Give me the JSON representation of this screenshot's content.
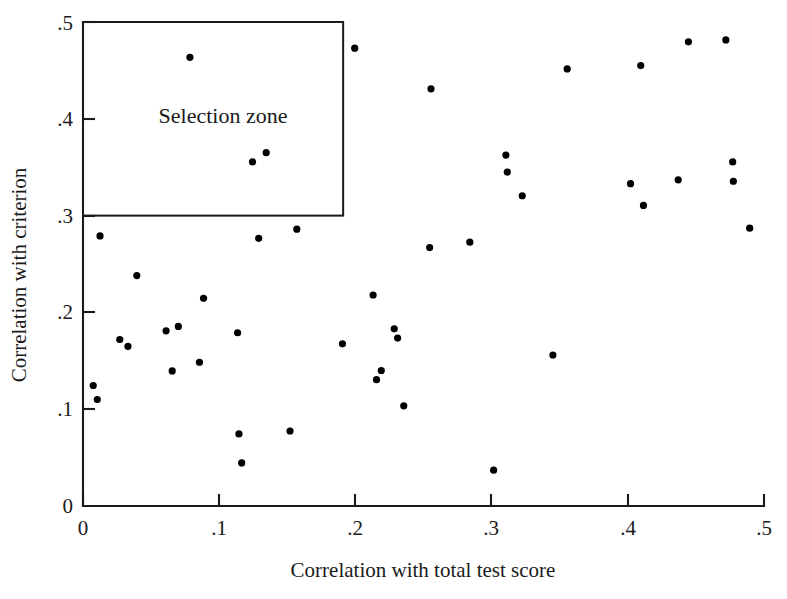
{
  "chart_data": {
    "type": "scatter",
    "title": "",
    "xlabel": "Correlation with total test score",
    "ylabel": "Correlation with criterion",
    "xlim": [
      0,
      0.5
    ],
    "ylim": [
      0,
      0.5
    ],
    "grid": false,
    "legend": null,
    "xticks": [
      0,
      0.1,
      0.2,
      0.3,
      0.4,
      0.5
    ],
    "yticks": [
      0,
      0.1,
      0.2,
      0.3,
      0.4,
      0.5
    ],
    "xtick_labels": [
      "0",
      ".1",
      ".2",
      ".3",
      ".4",
      ".5"
    ],
    "ytick_labels": [
      "0",
      ".1",
      ".2",
      ".3",
      ".4",
      ".5"
    ],
    "annotations": [
      {
        "name": "selection-zone",
        "label": "Selection zone",
        "x_range": [
          0.0,
          0.191
        ],
        "y_range": [
          0.3,
          0.5
        ]
      }
    ],
    "marker": {
      "shape": "circle",
      "color": "#000000",
      "size_px": 7.2
    },
    "points": [
      {
        "x": 0.0785,
        "y": 0.4635
      },
      {
        "x": 0.1245,
        "y": 0.3555
      },
      {
        "x": 0.1345,
        "y": 0.365
      },
      {
        "x": 0.1995,
        "y": 0.473
      },
      {
        "x": 0.2555,
        "y": 0.431
      },
      {
        "x": 0.3555,
        "y": 0.4515
      },
      {
        "x": 0.4095,
        "y": 0.455
      },
      {
        "x": 0.4445,
        "y": 0.4795
      },
      {
        "x": 0.472,
        "y": 0.4815
      },
      {
        "x": 0.0125,
        "y": 0.279
      },
      {
        "x": 0.0395,
        "y": 0.238
      },
      {
        "x": 0.129,
        "y": 0.2765
      },
      {
        "x": 0.157,
        "y": 0.286
      },
      {
        "x": 0.2545,
        "y": 0.267
      },
      {
        "x": 0.284,
        "y": 0.2725
      },
      {
        "x": 0.3105,
        "y": 0.3625
      },
      {
        "x": 0.3115,
        "y": 0.345
      },
      {
        "x": 0.3225,
        "y": 0.3205
      },
      {
        "x": 0.402,
        "y": 0.333
      },
      {
        "x": 0.4115,
        "y": 0.3105
      },
      {
        "x": 0.437,
        "y": 0.337
      },
      {
        "x": 0.477,
        "y": 0.3555
      },
      {
        "x": 0.4775,
        "y": 0.3355
      },
      {
        "x": 0.4895,
        "y": 0.287
      },
      {
        "x": 0.0885,
        "y": 0.2145
      },
      {
        "x": 0.213,
        "y": 0.218
      },
      {
        "x": 0.027,
        "y": 0.172
      },
      {
        "x": 0.033,
        "y": 0.165
      },
      {
        "x": 0.061,
        "y": 0.181
      },
      {
        "x": 0.07,
        "y": 0.1855
      },
      {
        "x": 0.1135,
        "y": 0.179
      },
      {
        "x": 0.1905,
        "y": 0.1675
      },
      {
        "x": 0.2285,
        "y": 0.183
      },
      {
        "x": 0.231,
        "y": 0.1735
      },
      {
        "x": 0.345,
        "y": 0.156
      },
      {
        "x": 0.0655,
        "y": 0.1395
      },
      {
        "x": 0.0855,
        "y": 0.1485
      },
      {
        "x": 0.219,
        "y": 0.14
      },
      {
        "x": 0.2155,
        "y": 0.1305
      },
      {
        "x": 0.2355,
        "y": 0.1035
      },
      {
        "x": 0.0075,
        "y": 0.1245
      },
      {
        "x": 0.0105,
        "y": 0.11
      },
      {
        "x": 0.1145,
        "y": 0.0745
      },
      {
        "x": 0.152,
        "y": 0.0775
      },
      {
        "x": 0.1165,
        "y": 0.0445
      },
      {
        "x": 0.3015,
        "y": 0.037
      }
    ]
  },
  "axes": {
    "x_title": "Correlation with total test score",
    "y_title": "Correlation with criterion"
  }
}
